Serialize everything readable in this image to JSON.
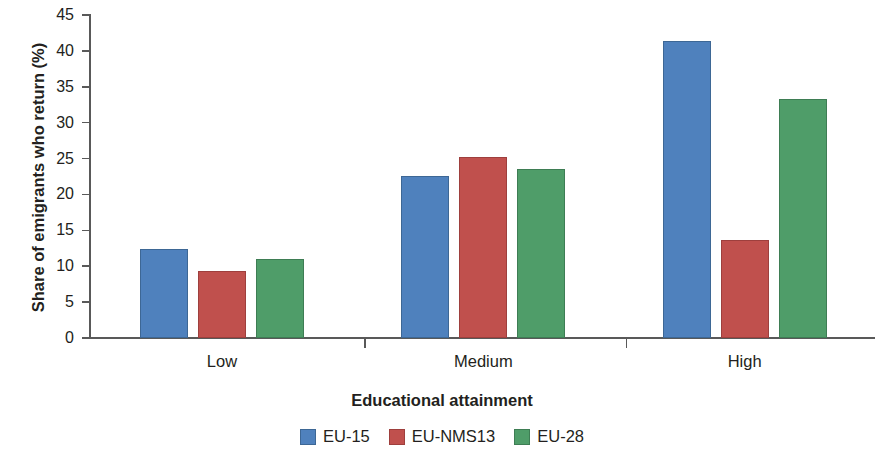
{
  "chart_data": {
    "type": "bar",
    "title": "",
    "xlabel": "Educational attainment",
    "ylabel": "Share of emigrants who return (%)",
    "categories": [
      "Low",
      "Medium",
      "High"
    ],
    "series": [
      {
        "name": "EU-15",
        "color": "#4f81bd",
        "values": [
          12.4,
          22.6,
          41.4
        ]
      },
      {
        "name": "EU-NMS13",
        "color": "#c0504d",
        "values": [
          9.3,
          25.2,
          13.7
        ]
      },
      {
        "name": "EU-28",
        "color": "#4f9d69",
        "values": [
          11.0,
          23.6,
          33.3
        ]
      }
    ],
    "ylim": [
      0,
      45
    ],
    "yticks": [
      0,
      5,
      10,
      15,
      20,
      25,
      30,
      35,
      40,
      45
    ],
    "ytick_labels": [
      "0",
      "5",
      "10",
      "15",
      "20",
      "25",
      "30",
      "35",
      "40",
      "45"
    ],
    "grid": false,
    "legend_position": "bottom"
  },
  "legend": {
    "items": [
      {
        "label": "EU-15"
      },
      {
        "label": "EU-NMS13"
      },
      {
        "label": "EU-28"
      }
    ]
  }
}
